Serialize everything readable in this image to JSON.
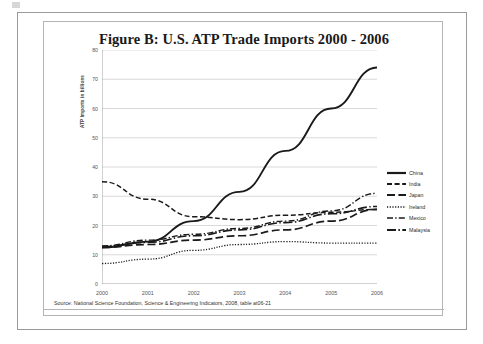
{
  "figure": {
    "title": "Figure B: U.S. ATP Trade Imports 2000 - 2006",
    "source": "Source: National Science Foundation, Science & Engineering Indicators, 2008, table at06-21"
  },
  "chart_data": {
    "type": "line",
    "title": "Figure B: U.S. ATP Trade Imports 2000 - 2006",
    "xlabel": "",
    "ylabel": "ATP Imports in billions",
    "x": [
      2000,
      2001,
      2002,
      2003,
      2004,
      2005,
      2006
    ],
    "xticklabels": [
      "2000",
      "2001",
      "2002",
      "2003",
      "2004",
      "2005",
      "2006"
    ],
    "yticklabels": [
      "0",
      "10",
      "20",
      "30",
      "40",
      "50",
      "60",
      "70",
      "80"
    ],
    "ylim": [
      0,
      80
    ],
    "ytick_step": 10,
    "grid": "horizontal",
    "legend_position": "right",
    "series": [
      {
        "name": "China",
        "style": "solid",
        "color": "#1a1a1a",
        "values": [
          12.5,
          14.5,
          21.5,
          31.5,
          45.5,
          60.0,
          74.0
        ]
      },
      {
        "name": "India",
        "style": "dashed",
        "color": "#1a1a1a",
        "values": [
          35.0,
          29.0,
          23.0,
          22.0,
          23.5,
          24.5,
          25.5
        ]
      },
      {
        "name": "Japan",
        "style": "long-dash",
        "color": "#1a1a1a",
        "values": [
          12.5,
          13.5,
          15.0,
          16.5,
          18.5,
          21.5,
          25.5
        ]
      },
      {
        "name": "Ireland",
        "style": "dotted",
        "color": "#1a1a1a",
        "values": [
          7.0,
          8.5,
          11.5,
          13.5,
          14.5,
          14.0,
          14.0
        ]
      },
      {
        "name": "Mexico",
        "style": "dash-dot",
        "color": "#1a1a1a",
        "values": [
          13.0,
          15.0,
          17.0,
          19.0,
          21.5,
          25.0,
          31.0
        ]
      },
      {
        "name": "Malaysia",
        "style": "dash-dot-long",
        "color": "#1a1a1a",
        "values": [
          12.8,
          14.2,
          16.5,
          18.5,
          21.0,
          24.0,
          26.5
        ]
      }
    ]
  }
}
